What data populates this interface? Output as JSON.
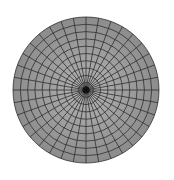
{
  "diagram": {
    "type": "polar-grid",
    "title": "Polar coordinate grid",
    "center": {
      "x": 86,
      "y": 90
    },
    "radius": 73,
    "rings": 10,
    "spokes": 36,
    "colors": {
      "background": "#ffffff",
      "fill_outer": "#8c8c8c",
      "fill_inner": "#b4b4b4",
      "lines": "#2e2e2e",
      "center": "#111111"
    }
  }
}
